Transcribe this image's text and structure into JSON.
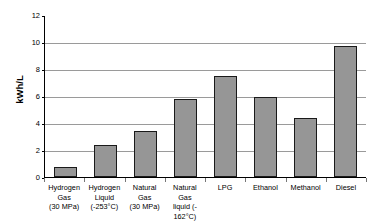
{
  "chart_data": {
    "type": "bar",
    "title": "",
    "subtitle": "",
    "xlabel": "",
    "ylabel": "kWh/L",
    "ylim": [
      0,
      12
    ],
    "yticks": [
      12,
      10,
      8,
      6,
      4,
      2,
      0
    ],
    "grid": true,
    "legend": "none",
    "categories": [
      "Hydrogen Gas (30 MPa)",
      "Hydrogen Liquid (-253°C)",
      "Natural Gas (30 MPa)",
      "Natural Gas liquid (-162°C)",
      "LPG",
      "Ethanol",
      "Methanol",
      "Diesel"
    ],
    "category_lines": [
      [
        "Hydrogen",
        "Gas",
        "(30 MPa)"
      ],
      [
        "Hydrogen",
        "Liquid",
        "(-253°C)"
      ],
      [
        "Natural",
        "Gas",
        "(30 MPa)"
      ],
      [
        "Natural Gas",
        "liquid (-",
        "162°C)"
      ],
      [
        "LPG"
      ],
      [
        "Ethanol"
      ],
      [
        "Methanol"
      ],
      [
        "Diesel"
      ]
    ],
    "values": [
      0.75,
      2.35,
      3.4,
      5.8,
      7.45,
      5.9,
      4.4,
      9.7
    ],
    "colors": {
      "bar_fill": "#969696",
      "bar_border": "#1a1a1a",
      "gridline": "#9a9a9a",
      "axis": "#000000",
      "background": "#ffffff",
      "text": "#000000"
    }
  }
}
